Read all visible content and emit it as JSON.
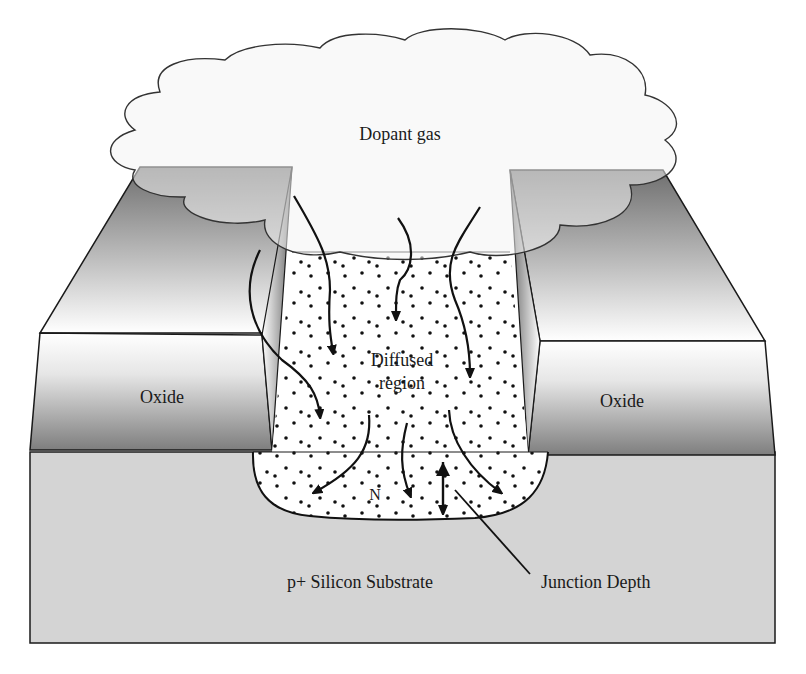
{
  "figure": {
    "type": "process-cross-section"
  },
  "labels": {
    "dopant_gas": "Dopant gas",
    "diffused_region_line1": "Diffused",
    "diffused_region_line2": "region",
    "oxide_left": "Oxide",
    "oxide_right": "Oxide",
    "n_region": "N",
    "substrate": "p+ Silicon Substrate",
    "junction_depth": "Junction Depth"
  },
  "colors": {
    "outline": "#1a1a1a",
    "oxide_dark": "#7a7a7a",
    "oxide_light": "#ffffff",
    "substrate": "#d4d4d4",
    "cloud_fill": "#f7f7f7",
    "diffused_fill": "#ffffff",
    "dot": "#111111"
  },
  "diagram": {
    "nodes": [
      {
        "id": "gas",
        "label": "Dopant gas",
        "shape": "cloud"
      },
      {
        "id": "oxide_l",
        "label": "Oxide",
        "shape": "block"
      },
      {
        "id": "oxide_r",
        "label": "Oxide",
        "shape": "block"
      },
      {
        "id": "diffused",
        "label": "Diffused region",
        "shape": "dotted-region"
      },
      {
        "id": "n",
        "label": "N",
        "shape": "dotted-well"
      },
      {
        "id": "substrate",
        "label": "p+ Silicon Substrate",
        "shape": "slab"
      },
      {
        "id": "jd",
        "label": "Junction Depth",
        "shape": "dimension-arrow"
      }
    ],
    "edges": [
      {
        "from": "gas",
        "to": "diffused",
        "kind": "diffusion-arrow",
        "count": 4
      },
      {
        "from": "diffused",
        "to": "n",
        "kind": "diffusion-arrow",
        "count": 3
      }
    ]
  }
}
